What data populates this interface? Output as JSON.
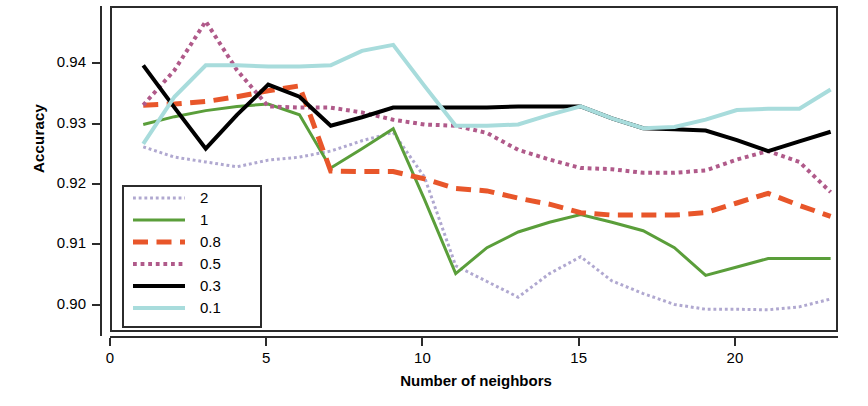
{
  "chart_data": {
    "type": "line",
    "title": "",
    "xlabel": "Number of neighbors",
    "ylabel": "Accuracy",
    "xlim": [
      0,
      23.3
    ],
    "ylim": [
      0.8955,
      0.9495
    ],
    "grid": false,
    "legend_position": "bottom-left",
    "xticks": [
      "0",
      "5",
      "10",
      "15",
      "20"
    ],
    "xtick_values": [
      0,
      5,
      10,
      15,
      20
    ],
    "yticks": [
      "0.90",
      "0.91",
      "0.92",
      "0.93",
      "0.94"
    ],
    "ytick_values": [
      0.9,
      0.91,
      0.92,
      0.93,
      0.94
    ],
    "x": [
      1,
      2,
      3,
      4,
      5,
      6,
      7,
      8,
      9,
      10,
      11,
      12,
      13,
      14,
      15,
      16,
      17,
      18,
      19,
      20,
      21,
      22,
      23
    ],
    "series": [
      {
        "name": "2",
        "color": "#b0a8d0",
        "style": "dotted",
        "width": 3,
        "values": [
          0.9265,
          0.9248,
          0.924,
          0.9232,
          0.9243,
          0.9248,
          0.9258,
          0.9275,
          0.9289,
          0.9215,
          0.9068,
          0.9042,
          0.9016,
          0.9055,
          0.9083,
          0.9043,
          0.9022,
          0.9004,
          0.8996,
          0.8996,
          0.8995,
          0.9,
          0.9013
        ]
      },
      {
        "name": "1",
        "color": "#5a9e3a",
        "style": "solid",
        "width": 3,
        "values": [
          0.9302,
          0.9315,
          0.9325,
          0.9332,
          0.9336,
          0.9318,
          0.923,
          0.9262,
          0.9295,
          0.9178,
          0.9055,
          0.9098,
          0.9124,
          0.914,
          0.9153,
          0.914,
          0.9126,
          0.9098,
          0.9052,
          0.9066,
          0.908,
          0.908,
          0.908
        ]
      },
      {
        "name": "0.8",
        "color": "#e8562a",
        "style": "dashed",
        "width": 5,
        "values": [
          0.9334,
          0.9336,
          0.934,
          0.9348,
          0.9358,
          0.9366,
          0.9225,
          0.9224,
          0.9224,
          0.9212,
          0.9196,
          0.9192,
          0.918,
          0.917,
          0.9156,
          0.9152,
          0.9152,
          0.9152,
          0.9156,
          0.9172,
          0.9188,
          0.9168,
          0.915
        ]
      },
      {
        "name": "0.5",
        "color": "#b05a8a",
        "style": "dotted",
        "width": 4,
        "values": [
          0.9334,
          0.9392,
          0.9473,
          0.9392,
          0.9332,
          0.933,
          0.933,
          0.9322,
          0.931,
          0.9302,
          0.93,
          0.9288,
          0.926,
          0.9244,
          0.923,
          0.9228,
          0.9222,
          0.9222,
          0.9226,
          0.9244,
          0.9258,
          0.924,
          0.919
        ]
      },
      {
        "name": "0.3",
        "color": "#000000",
        "style": "solid",
        "width": 4,
        "values": [
          0.94,
          0.933,
          0.9262,
          0.9318,
          0.9368,
          0.9348,
          0.93,
          0.9314,
          0.933,
          0.933,
          0.933,
          0.933,
          0.9332,
          0.9332,
          0.9332,
          0.9312,
          0.9296,
          0.9294,
          0.9292,
          0.9276,
          0.9258,
          0.9274,
          0.929
        ]
      },
      {
        "name": "0.1",
        "color": "#a8dcdc",
        "style": "solid",
        "width": 4,
        "values": [
          0.927,
          0.9348,
          0.94,
          0.94,
          0.9398,
          0.9398,
          0.94,
          0.9424,
          0.9434,
          0.9366,
          0.93,
          0.93,
          0.9302,
          0.9318,
          0.9332,
          0.9312,
          0.9296,
          0.9298,
          0.931,
          0.9326,
          0.9328,
          0.9328,
          0.936
        ]
      }
    ]
  },
  "legend": {
    "entries": [
      {
        "label": "2"
      },
      {
        "label": "1"
      },
      {
        "label": "0.8"
      },
      {
        "label": "0.5"
      },
      {
        "label": "0.3"
      },
      {
        "label": "0.1"
      }
    ]
  }
}
